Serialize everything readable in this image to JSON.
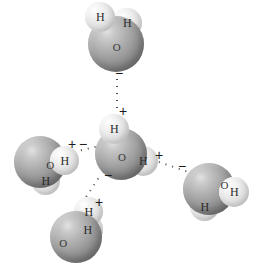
{
  "figure": {
    "background_color": "#ffffff",
    "oxygen_color": "#8f8f8f",
    "hydrogen_color": "#e6e6e6",
    "bond_color": "#4a4a4a",
    "label_color": "#2b2b2b"
  },
  "molecules": [
    {
      "id": "water-top",
      "oxygen": {
        "label": "O",
        "x": 88,
        "y": 16,
        "size": 56
      },
      "hydrogens": [
        {
          "label": "H",
          "x": 85,
          "y": 2,
          "size": 30
        },
        {
          "label": "H",
          "x": 112,
          "y": 8,
          "size": 30
        }
      ]
    },
    {
      "id": "water-center",
      "oxygen": {
        "label": "O",
        "x": 95,
        "y": 128,
        "size": 52
      },
      "hydrogens": [
        {
          "label": "H",
          "x": 99,
          "y": 114,
          "size": 30
        },
        {
          "label": "H",
          "x": 128,
          "y": 146,
          "size": 30
        }
      ]
    },
    {
      "id": "water-left",
      "oxygen": {
        "label": "O",
        "x": 14,
        "y": 136,
        "size": 52
      },
      "hydrogens": [
        {
          "label": "H",
          "x": 50,
          "y": 146,
          "size": 29
        },
        {
          "label": "H",
          "x": 31,
          "y": 166,
          "size": 29
        }
      ]
    },
    {
      "id": "water-right",
      "oxygen": {
        "label": "O",
        "x": 183,
        "y": 163,
        "size": 52
      },
      "hydrogens": [
        {
          "label": "H",
          "x": 219,
          "y": 177,
          "size": 30
        },
        {
          "label": "H",
          "x": 190,
          "y": 192,
          "size": 29
        }
      ]
    },
    {
      "id": "water-bottom",
      "oxygen": {
        "label": "O",
        "x": 50,
        "y": 211,
        "size": 52
      },
      "hydrogens": [
        {
          "label": "H",
          "x": 74,
          "y": 197,
          "size": 29
        },
        {
          "label": "H",
          "x": 72,
          "y": 214,
          "size": 31
        }
      ]
    }
  ],
  "hydrogen_bonds": [
    {
      "id": "bond-top",
      "x1": 117,
      "y1": 76,
      "x2": 117,
      "y2": 114
    },
    {
      "id": "bond-left",
      "x1": 78,
      "y1": 151,
      "x2": 99,
      "y2": 146
    },
    {
      "id": "bond-right",
      "x1": 156,
      "y1": 161,
      "x2": 206,
      "y2": 178
    },
    {
      "id": "bond-bottom",
      "x1": 100,
      "y1": 176,
      "x2": 82,
      "y2": 203
    }
  ],
  "charges": [
    {
      "id": "charge-top-minus",
      "sign": "−",
      "x": 115,
      "y": 66
    },
    {
      "id": "charge-top-plus",
      "sign": "+",
      "x": 119,
      "y": 104
    },
    {
      "id": "charge-left-plus",
      "sign": "+",
      "x": 68,
      "y": 137
    },
    {
      "id": "charge-left-minus",
      "sign": "−",
      "x": 79,
      "y": 137
    },
    {
      "id": "charge-right-plus",
      "sign": "+",
      "x": 155,
      "y": 148
    },
    {
      "id": "charge-right-minus",
      "sign": "−",
      "x": 178,
      "y": 159
    },
    {
      "id": "charge-bottom-minus",
      "sign": "−",
      "x": 104,
      "y": 168
    },
    {
      "id": "charge-bottom-plus",
      "sign": "+",
      "x": 95,
      "y": 195
    }
  ]
}
